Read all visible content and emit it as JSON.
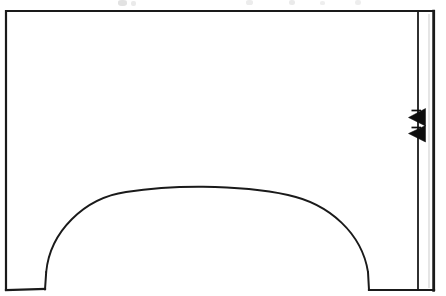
{
  "document": {
    "kind": "scanned-line-drawing",
    "title": "Wall elevation with segmental arch opening",
    "background_color": "#ffffff",
    "ink_color": "#1a1a1a",
    "page_width": 446,
    "page_height": 296
  },
  "chart_data": {
    "type": "diagram",
    "xlabel": "",
    "ylabel": "",
    "xlim": [
      0,
      446
    ],
    "ylim": [
      0,
      296
    ],
    "grid": false,
    "legend": null,
    "units": "pixels",
    "elements": [
      {
        "name": "outer-wall-outline",
        "type": "polyline",
        "stroke": "#1a1a1a",
        "stroke_width": 2.2,
        "closed": false,
        "points": [
          [
            6,
            290
          ],
          [
            6,
            11
          ],
          [
            434,
            11
          ],
          [
            434,
            290
          ]
        ]
      },
      {
        "name": "left-pier-base",
        "type": "polyline",
        "stroke": "#1a1a1a",
        "stroke_width": 2.2,
        "points": [
          [
            6,
            290
          ],
          [
            45,
            289
          ]
        ]
      },
      {
        "name": "right-pier-base",
        "type": "polyline",
        "stroke": "#1a1a1a",
        "stroke_width": 2.2,
        "points": [
          [
            369,
            290
          ],
          [
            434,
            290
          ]
        ]
      },
      {
        "name": "left-arch-springing-stub",
        "type": "polyline",
        "stroke": "#1a1a1a",
        "stroke_width": 2.0,
        "points": [
          [
            45,
            289
          ],
          [
            46,
            272
          ]
        ]
      },
      {
        "name": "right-arch-springing-stub",
        "type": "polyline",
        "stroke": "#1a1a1a",
        "stroke_width": 2.0,
        "points": [
          [
            369,
            290
          ],
          [
            368,
            272
          ]
        ]
      },
      {
        "name": "segmental-arch-intrados",
        "type": "arc-curve",
        "stroke": "#1a1a1a",
        "stroke_width": 1.9,
        "fill": "none",
        "springing_left": [
          46,
          272
        ],
        "springing_right": [
          368,
          272
        ],
        "apex": [
          203,
          187
        ],
        "span": 322,
        "rise": 85
      },
      {
        "name": "right-section-strip-inner-line",
        "type": "line",
        "stroke": "#1a1a1a",
        "stroke_width": 1.8,
        "points": [
          [
            418,
            11
          ],
          [
            418,
            290
          ]
        ]
      },
      {
        "name": "right-section-strip-outer-line",
        "type": "line",
        "stroke": "#1a1a1a",
        "stroke_width": 2.4,
        "points": [
          [
            434,
            11
          ],
          [
            434,
            290
          ]
        ]
      },
      {
        "name": "section-arrow-upper",
        "type": "triangle-marker",
        "fill": "#0d0d0d",
        "direction": "left",
        "tip": [
          409,
          117
        ],
        "base_top": [
          425,
          109
        ],
        "base_bottom": [
          425,
          125
        ]
      },
      {
        "name": "section-arrow-lower",
        "type": "triangle-marker",
        "fill": "#0d0d0d",
        "direction": "left",
        "tip": [
          409,
          133
        ],
        "base_top": [
          425,
          126
        ],
        "base_bottom": [
          425,
          141
        ]
      },
      {
        "name": "arrow-tail-upper",
        "type": "line",
        "stroke": "#0d0d0d",
        "stroke_width": 1.6,
        "points": [
          [
            412,
            110
          ],
          [
            421,
            110
          ]
        ]
      },
      {
        "name": "arrow-tail-lower",
        "type": "line",
        "stroke": "#0d0d0d",
        "stroke_width": 1.6,
        "points": [
          [
            412,
            128
          ],
          [
            421,
            128
          ]
        ]
      }
    ],
    "scan_artifacts": {
      "description": "faint clipped glyph fragments along the top edge of the scan",
      "marks": [
        {
          "x": 118,
          "y": 0,
          "w": 9,
          "h": 6,
          "opacity": 0.42
        },
        {
          "x": 131,
          "y": 1,
          "w": 5,
          "h": 5,
          "opacity": 0.3
        },
        {
          "x": 246,
          "y": 0,
          "w": 7,
          "h": 5,
          "opacity": 0.28
        },
        {
          "x": 289,
          "y": 0,
          "w": 6,
          "h": 5,
          "opacity": 0.3
        },
        {
          "x": 320,
          "y": 1,
          "w": 5,
          "h": 4,
          "opacity": 0.24
        },
        {
          "x": 355,
          "y": 0,
          "w": 6,
          "h": 5,
          "opacity": 0.26
        }
      ]
    }
  }
}
